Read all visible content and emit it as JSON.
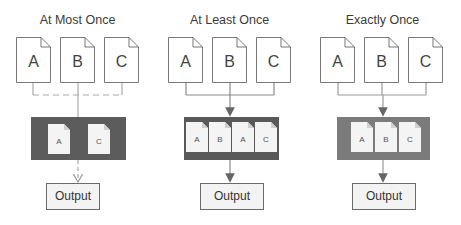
{
  "diagram": {
    "panels": [
      {
        "title": "At Most Once",
        "inputs": [
          "A",
          "B",
          "C"
        ],
        "connector_style": "dashed",
        "queue_items": [
          "A",
          "C"
        ],
        "queue_color": "#5c5c5c",
        "output_label": "Output"
      },
      {
        "title": "At Least Once",
        "inputs": [
          "A",
          "B",
          "C"
        ],
        "connector_style": "solid",
        "queue_items": [
          "A",
          "B",
          "A",
          "C"
        ],
        "queue_color": "#595959",
        "output_label": "Output"
      },
      {
        "title": "Exactly Once",
        "inputs": [
          "A",
          "B",
          "C"
        ],
        "connector_style": "solid",
        "queue_items": [
          "A",
          "B",
          "C"
        ],
        "queue_color": "#7b7b7b",
        "output_label": "Output"
      }
    ]
  }
}
